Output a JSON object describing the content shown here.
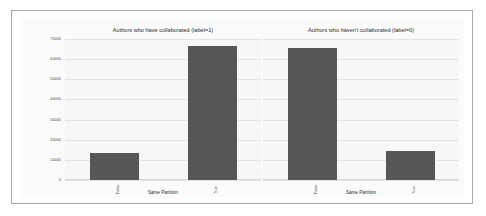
{
  "chart_data": {
    "type": "bar",
    "title": "",
    "panels": [
      {
        "title": "Authors who have collaborated (label=1)",
        "xlabel": "Same Partition",
        "ylabel": "",
        "categories": [
          "False",
          "True"
        ],
        "values": [
          13500,
          66500
        ]
      },
      {
        "title": "Authors who haven't collaborated (label=0)",
        "xlabel": "Same Partition",
        "ylabel": "",
        "categories": [
          "False",
          "True"
        ],
        "values": [
          65500,
          14500
        ]
      }
    ],
    "ylim": [
      0,
      70000
    ],
    "yticks": [
      0,
      10000,
      20000,
      30000,
      40000,
      50000,
      60000,
      70000
    ],
    "ytick_labels": [
      "0",
      "10000",
      "20000",
      "30000",
      "40000",
      "50000",
      "60000",
      "70000"
    ],
    "grid": true,
    "legend": null,
    "bar_color": "#565656",
    "plot_background": "#f7f7f7",
    "figure_background": "#fbfbfb",
    "gridline_color": "#e3e3e3",
    "frame_border_color": "#a9a9ac"
  }
}
